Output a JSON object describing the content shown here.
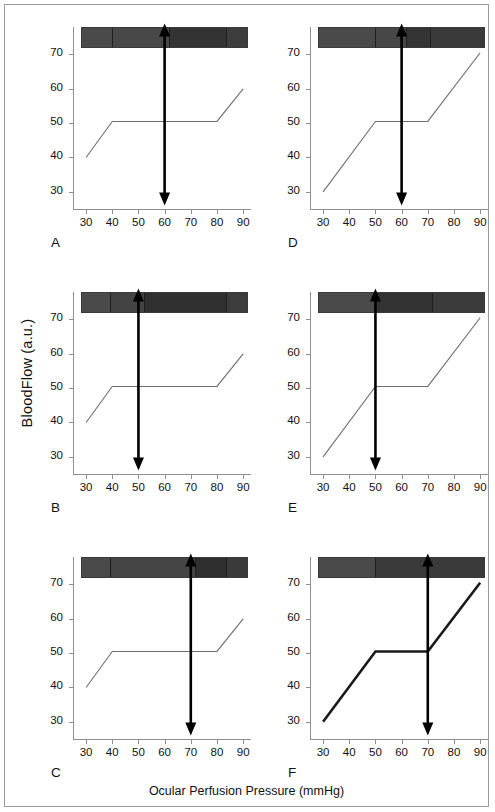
{
  "figure": {
    "ylabel": "BloodFlow (a.u.)",
    "xlabel": "Ocular Perfusion Pressure (mmHg)",
    "frame_color": "#9a9a9a",
    "axis_color": "#8f8f8f",
    "curve_color_thin": "#6e6e6e",
    "curve_color_thick": "#1a1a1a",
    "arrow_color": "#000000"
  },
  "axes": {
    "x_ticks": [
      30,
      40,
      50,
      60,
      70,
      80,
      90
    ],
    "y_ticks": [
      30,
      40,
      50,
      60,
      70
    ],
    "xlim": [
      25,
      93
    ],
    "ylim": [
      25,
      78
    ]
  },
  "chart_data": [
    {
      "type": "line",
      "panel": "A",
      "title": "",
      "xlabel": "Ocular Perfusion Pressure (mmHg)",
      "ylabel": "BloodFlow (a.u.)",
      "xlim": [
        25,
        93
      ],
      "ylim": [
        25,
        78
      ],
      "grid": false,
      "legend": "none",
      "series": [
        {
          "name": "autoregulation-curve",
          "style": "thin",
          "x": [
            30,
            40,
            80,
            90
          ],
          "y": [
            40,
            50.5,
            50.5,
            60
          ]
        }
      ],
      "annotations": [
        {
          "kind": "double-arrow-vertical",
          "x": 60,
          "y_from": 26,
          "y_to": 79
        }
      ],
      "bar": {
        "y_top": 72.0,
        "y_bottom": 78.0,
        "x_from": 28,
        "x_to": 92,
        "segments": [
          {
            "x_from": 28,
            "x_to": 40,
            "color": "#4a4a4a"
          },
          {
            "x_from": 40,
            "x_to": 62,
            "color": "#484848"
          },
          {
            "x_from": 62,
            "x_to": 84,
            "color": "#333333"
          },
          {
            "x_from": 84,
            "x_to": 92,
            "color": "#3d3d3d"
          }
        ]
      }
    },
    {
      "type": "line",
      "panel": "D",
      "title": "",
      "xlabel": "Ocular Perfusion Pressure (mmHg)",
      "ylabel": "BloodFlow (a.u.)",
      "xlim": [
        25,
        93
      ],
      "ylim": [
        25,
        78
      ],
      "grid": false,
      "legend": "none",
      "series": [
        {
          "name": "autoregulation-curve",
          "style": "thin",
          "x": [
            30,
            50,
            70,
            90
          ],
          "y": [
            30,
            50.5,
            50.5,
            70.5
          ]
        }
      ],
      "annotations": [
        {
          "kind": "double-arrow-vertical",
          "x": 60,
          "y_from": 26,
          "y_to": 79
        }
      ],
      "bar": {
        "y_top": 72.0,
        "y_bottom": 78.0,
        "x_from": 28,
        "x_to": 92,
        "segments": [
          {
            "x_from": 28,
            "x_to": 50,
            "color": "#4a4a4a"
          },
          {
            "x_from": 50,
            "x_to": 62,
            "color": "#474747"
          },
          {
            "x_from": 62,
            "x_to": 71,
            "color": "#343434"
          },
          {
            "x_from": 71,
            "x_to": 92,
            "color": "#3a3a3a"
          }
        ]
      }
    },
    {
      "type": "line",
      "panel": "B",
      "title": "",
      "xlabel": "Ocular Perfusion Pressure (mmHg)",
      "ylabel": "BloodFlow (a.u.)",
      "xlim": [
        25,
        93
      ],
      "ylim": [
        25,
        78
      ],
      "grid": false,
      "legend": "none",
      "series": [
        {
          "name": "autoregulation-curve",
          "style": "thin",
          "x": [
            30,
            40,
            80,
            90
          ],
          "y": [
            40,
            50.5,
            50.5,
            60
          ]
        }
      ],
      "annotations": [
        {
          "kind": "double-arrow-vertical",
          "x": 50,
          "y_from": 26,
          "y_to": 79
        }
      ],
      "bar": {
        "y_top": 72.0,
        "y_bottom": 78.0,
        "x_from": 28,
        "x_to": 92,
        "segments": [
          {
            "x_from": 28,
            "x_to": 39,
            "color": "#4a4a4a"
          },
          {
            "x_from": 39,
            "x_to": 52,
            "color": "#434343"
          },
          {
            "x_from": 52,
            "x_to": 84,
            "color": "#303030"
          },
          {
            "x_from": 84,
            "x_to": 92,
            "color": "#3c3c3c"
          }
        ]
      }
    },
    {
      "type": "line",
      "panel": "E",
      "title": "",
      "xlabel": "Ocular Perfusion Pressure (mmHg)",
      "ylabel": "BloodFlow (a.u.)",
      "xlim": [
        25,
        93
      ],
      "ylim": [
        25,
        78
      ],
      "grid": false,
      "legend": "none",
      "series": [
        {
          "name": "autoregulation-curve",
          "style": "thin",
          "x": [
            30,
            50,
            70,
            90
          ],
          "y": [
            30,
            50.5,
            50.5,
            70.5
          ]
        }
      ],
      "annotations": [
        {
          "kind": "double-arrow-vertical",
          "x": 50,
          "y_from": 26,
          "y_to": 79
        }
      ],
      "bar": {
        "y_top": 72.0,
        "y_bottom": 78.0,
        "x_from": 28,
        "x_to": 92,
        "segments": [
          {
            "x_from": 28,
            "x_to": 50,
            "color": "#4a4a4a"
          },
          {
            "x_from": 50,
            "x_to": 72,
            "color": "#323232"
          },
          {
            "x_from": 72,
            "x_to": 92,
            "color": "#3b3b3b"
          }
        ]
      }
    },
    {
      "type": "line",
      "panel": "C",
      "title": "",
      "xlabel": "Ocular Perfusion Pressure (mmHg)",
      "ylabel": "BloodFlow (a.u.)",
      "xlim": [
        25,
        93
      ],
      "ylim": [
        25,
        78
      ],
      "grid": false,
      "legend": "none",
      "series": [
        {
          "name": "autoregulation-curve",
          "style": "thin",
          "x": [
            30,
            40,
            80,
            90
          ],
          "y": [
            40,
            50.5,
            50.5,
            60
          ]
        }
      ],
      "annotations": [
        {
          "kind": "double-arrow-vertical",
          "x": 70,
          "y_from": 26,
          "y_to": 79
        }
      ],
      "bar": {
        "y_top": 72.0,
        "y_bottom": 78.0,
        "x_from": 28,
        "x_to": 92,
        "segments": [
          {
            "x_from": 28,
            "x_to": 39,
            "color": "#4a4a4a"
          },
          {
            "x_from": 39,
            "x_to": 72,
            "color": "#454545"
          },
          {
            "x_from": 72,
            "x_to": 84,
            "color": "#2f2f2f"
          },
          {
            "x_from": 84,
            "x_to": 92,
            "color": "#3a3a3a"
          }
        ]
      }
    },
    {
      "type": "line",
      "panel": "F",
      "title": "",
      "xlabel": "Ocular Perfusion Pressure (mmHg)",
      "ylabel": "BloodFlow (a.u.)",
      "xlim": [
        25,
        93
      ],
      "ylim": [
        25,
        78
      ],
      "grid": false,
      "legend": "none",
      "series": [
        {
          "name": "autoregulation-curve",
          "style": "thick",
          "x": [
            30,
            50,
            70,
            90
          ],
          "y": [
            30,
            50.5,
            50.5,
            70.5
          ]
        }
      ],
      "annotations": [
        {
          "kind": "double-arrow-vertical",
          "x": 70,
          "y_from": 26,
          "y_to": 79
        }
      ],
      "bar": {
        "y_top": 72.0,
        "y_bottom": 78.0,
        "x_from": 28,
        "x_to": 92,
        "segments": [
          {
            "x_from": 28,
            "x_to": 50,
            "color": "#4a4a4a"
          },
          {
            "x_from": 50,
            "x_to": 92,
            "color": "#3a3a3a"
          }
        ]
      }
    }
  ]
}
